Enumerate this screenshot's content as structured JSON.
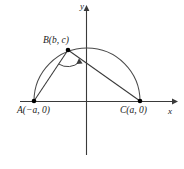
{
  "figure": {
    "kind": "coordinate-geometry-diagram",
    "background_color": "#ffffff",
    "stroke_color": "#333333",
    "point_color": "#000000"
  },
  "axes": {
    "x_label": "x",
    "y_label": "y",
    "origin_px": {
      "x": 86,
      "y": 101
    },
    "x_axis": {
      "from_px": 20,
      "to_px": 175,
      "y_px": 101,
      "arrow": "right"
    },
    "y_axis": {
      "from_px": 155,
      "to_px": 8,
      "x_px": 86,
      "arrow": "up"
    }
  },
  "points": [
    {
      "id": "A",
      "label": "A(−a, 0)",
      "coords": {
        "x": "-a",
        "y": "0"
      },
      "px": {
        "x": 34,
        "y": 101
      }
    },
    {
      "id": "B",
      "label": "B(b, c)",
      "coords": {
        "x": "b",
        "y": "c"
      },
      "px": {
        "x": 68,
        "y": 50
      }
    },
    {
      "id": "C",
      "label": "C(a, 0)",
      "coords": {
        "x": "a",
        "y": "0"
      },
      "px": {
        "x": 140,
        "y": 101
      }
    }
  ],
  "shapes": {
    "semicircle": {
      "name": "semicircle-AC",
      "from": "A",
      "to": "C",
      "radius_px": 53,
      "center_px": {
        "x": 87,
        "y": 101
      }
    },
    "segments": [
      {
        "name": "segment-AB",
        "from": "A",
        "to": "B"
      },
      {
        "name": "segment-BC",
        "from": "B",
        "to": "C"
      }
    ],
    "angle_mark": {
      "name": "angle-at-B",
      "vertex": "B",
      "between": [
        "A",
        "C"
      ],
      "style": "arc-with-arrowhead"
    }
  }
}
